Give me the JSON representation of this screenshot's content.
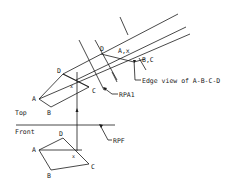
{
  "diagram": {
    "type": "descriptive-geometry-auxiliary-view",
    "views": {
      "top": {
        "label": "Top",
        "points": {
          "A": "A",
          "B": "B",
          "C": "C",
          "D": "D",
          "x": "x"
        }
      },
      "front": {
        "label": "Front",
        "points": {
          "A": "A",
          "B": "B",
          "C": "C",
          "D": "D",
          "x": "x"
        }
      },
      "auxiliary": {
        "points": {
          "D": "D",
          "Ax": "A,x",
          "BC": "B,C"
        }
      }
    },
    "reference_planes": {
      "rpa1": "RPA1",
      "rpf": "RPF"
    },
    "annotations": {
      "edge_view": "Edge view of A-B-C-D"
    }
  }
}
